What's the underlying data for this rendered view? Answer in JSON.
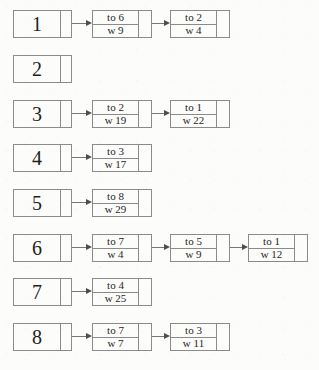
{
  "diagram": {
    "kind": "adjacency-list",
    "border_color": "#8b8b8b",
    "arrow_color": "#4d4d4d",
    "text_color": "#1f1f1f",
    "background": "#fcfcfb"
  },
  "rows": [
    {
      "vertex": "1",
      "edges": [
        {
          "to": "to 6",
          "w": "w 9"
        },
        {
          "to": "to 2",
          "w": "w 4"
        }
      ]
    },
    {
      "vertex": "2",
      "edges": []
    },
    {
      "vertex": "3",
      "edges": [
        {
          "to": "to 2",
          "w": "w 19"
        },
        {
          "to": "to 1",
          "w": "w 22"
        }
      ]
    },
    {
      "vertex": "4",
      "edges": [
        {
          "to": "to 3",
          "w": "w 17"
        }
      ]
    },
    {
      "vertex": "5",
      "edges": [
        {
          "to": "to 8",
          "w": "w 29"
        }
      ]
    },
    {
      "vertex": "6",
      "edges": [
        {
          "to": "to 7",
          "w": "w 4"
        },
        {
          "to": "to 5",
          "w": "w 9"
        },
        {
          "to": "to 1",
          "w": "w 12"
        }
      ]
    },
    {
      "vertex": "7",
      "edges": [
        {
          "to": "to 4",
          "w": "w 25"
        }
      ]
    },
    {
      "vertex": "8",
      "edges": [
        {
          "to": "to 7",
          "w": "w 7"
        },
        {
          "to": "to 3",
          "w": "w 11"
        }
      ]
    }
  ]
}
